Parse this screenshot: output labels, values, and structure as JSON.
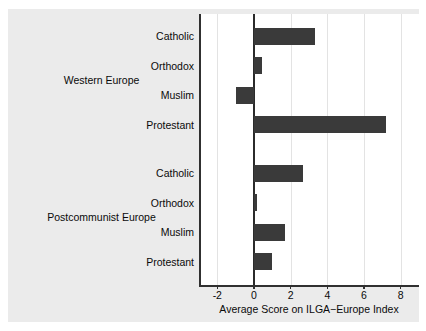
{
  "chart_data": {
    "type": "bar",
    "orientation": "horizontal",
    "title": "",
    "subtitle": "",
    "xlabel": "Average Score on ILGA−Europe Index",
    "ylabel": "",
    "xlim": [
      -3,
      9
    ],
    "xticks": [
      -2,
      0,
      2,
      4,
      6,
      8
    ],
    "xtick_labels": [
      "-2",
      "0",
      "2",
      "4",
      "6",
      "8"
    ],
    "grid": "vertical",
    "legend": "none",
    "bar_color": "#3a3a3a",
    "panel_background": "#ffffff",
    "figure_background": "#ebebeb",
    "zero_line": 0,
    "groups": [
      {
        "label": "Western Europe",
        "categories": [
          "Catholic",
          "Orthodox",
          "Muslim",
          "Protestant"
        ],
        "values": [
          3.3,
          0.45,
          -1.0,
          7.2
        ]
      },
      {
        "label": "Postcommunist Europe",
        "categories": [
          "Catholic",
          "Orthodox",
          "Muslim",
          "Protestant"
        ],
        "values": [
          2.65,
          0.15,
          1.7,
          1.0
        ]
      }
    ]
  }
}
